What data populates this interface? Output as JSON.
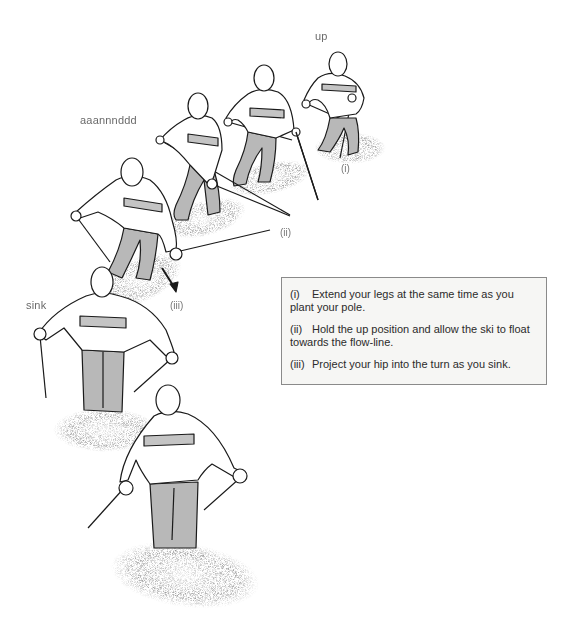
{
  "labels": {
    "up": "up",
    "and": "aaannnddd",
    "sink": "sink"
  },
  "phase_markers": {
    "i": "(i)",
    "ii": "(ii)",
    "iii": "(iii)"
  },
  "instructions": [
    {
      "num": "(i)",
      "text": "Extend your legs at the same time as you plant your pole."
    },
    {
      "num": "(ii)",
      "text": "Hold the up position and allow the ski to float towards the flow-line."
    },
    {
      "num": "(iii)",
      "text": "Project your hip into the turn as you sink."
    }
  ],
  "colors": {
    "line": "#1a1a1a",
    "trousers": "#b8b8b8",
    "stripe": "#c4c4c4",
    "snow": "#555555",
    "box_bg": "#f6f6f4",
    "box_border": "#8a8a8a"
  }
}
